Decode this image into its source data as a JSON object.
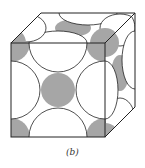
{
  "figure": {
    "caption": "(b)",
    "colors": {
      "atom_fill": "#a6a6a6",
      "line": "#222222",
      "background": "#ffffff"
    }
  }
}
